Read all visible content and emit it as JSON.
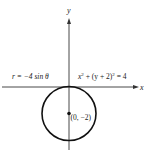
{
  "diagram": {
    "type": "polar-circle-plot",
    "axes": {
      "x_label": "x",
      "y_label": "y"
    },
    "curve": {
      "polar_equation": "r = −4 sin θ",
      "cartesian_equation_lhs_x": "x",
      "cartesian_equation_plus": " + (y + 2)",
      "cartesian_equation_exp": "2",
      "cartesian_equation_rhs": " = 4",
      "center": [
        0,
        -2
      ],
      "radius": 2
    },
    "point": {
      "label": "(0, −2)",
      "coords": [
        0,
        -2
      ]
    },
    "colors": {
      "stroke": "#111111",
      "axis": "#333333",
      "text": "#222222"
    }
  }
}
